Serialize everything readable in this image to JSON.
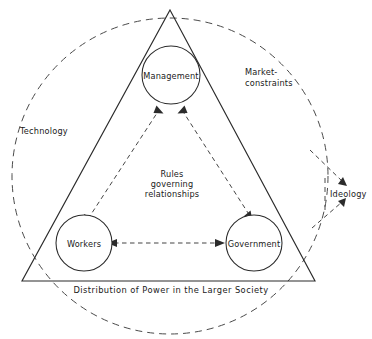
{
  "diagram": {
    "nodes": [
      {
        "id": "management",
        "label": "Management"
      },
      {
        "id": "workers",
        "label": "Workers"
      },
      {
        "id": "government",
        "label": "Government"
      }
    ],
    "center_text": {
      "line1": "Rules",
      "line2": "governing",
      "line3": "relationships"
    },
    "environment_labels": [
      {
        "id": "technology",
        "label": "Technology"
      },
      {
        "id": "market-constraints-line1",
        "label": "Market-"
      },
      {
        "id": "market-constraints-line2",
        "label": "constraints"
      },
      {
        "id": "ideology",
        "label": "Ideology"
      }
    ],
    "caption": "Distribution of Power in the Larger Society",
    "colors": {
      "line": "#2b2b2b",
      "dashed": "#4a4a4a",
      "text": "#1a1a1a",
      "background": "#ffffff"
    }
  }
}
